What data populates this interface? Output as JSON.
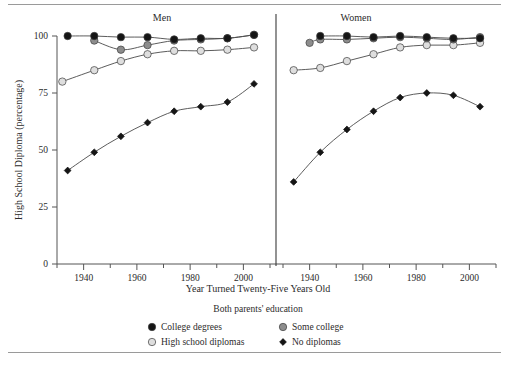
{
  "figure": {
    "ylabel": "High School Diploma (percentage)",
    "xlabel": "Year Turned Twenty-Five Years Old",
    "panel_men": "Men",
    "panel_women": "Women",
    "legend_title": "Both parents' education"
  },
  "axes": {
    "yticks": [
      "0",
      "25",
      "50",
      "75",
      "100"
    ],
    "xticks": [
      "1940",
      "1960",
      "1980",
      "2000"
    ]
  },
  "legend": {
    "items": [
      {
        "label": "College degrees",
        "marker": "filled-circle-icon",
        "color": "#151515"
      },
      {
        "label": "Some college",
        "marker": "gray-circle-icon",
        "color": "#8d8d8d"
      },
      {
        "label": "High school diplomas",
        "marker": "light-circle-icon",
        "color": "#dedede"
      },
      {
        "label": "No diplomas",
        "marker": "filled-diamond-icon",
        "color": "#151515"
      }
    ]
  },
  "chart_data": {
    "type": "line",
    "title": "",
    "xlabel": "Year Turned Twenty-Five Years Old",
    "ylabel": "High School Diploma (percentage)",
    "xlim": [
      1930,
      2010
    ],
    "ylim": [
      0,
      100
    ],
    "grid": false,
    "legend_position": "bottom",
    "legend_title": "Both parents' education",
    "panels": [
      {
        "name": "Men",
        "series": [
          {
            "name": "College degrees",
            "color": "#151515",
            "marker": "circle",
            "x": [
              1934,
              1944,
              1954,
              1964,
              1974,
              1984,
              1994,
              2004
            ],
            "values": [
              100,
              100,
              99.5,
              99.5,
              98.5,
              99,
              99,
              100.5
            ]
          },
          {
            "name": "Some college",
            "color": "#8d8d8d",
            "marker": "circle",
            "x": [
              1944,
              1954,
              1964,
              1974,
              1984,
              1994,
              2004
            ],
            "values": [
              98,
              94,
              96,
              98,
              98.5,
              99,
              100.5
            ]
          },
          {
            "name": "High school diplomas",
            "color": "#dedede",
            "marker": "circle",
            "x": [
              1932,
              1944,
              1954,
              1964,
              1974,
              1984,
              1994,
              2004
            ],
            "values": [
              80,
              85,
              89,
              92,
              93.5,
              93.5,
              94,
              95
            ]
          },
          {
            "name": "No diplomas",
            "color": "#151515",
            "marker": "diamond",
            "x": [
              1934,
              1944,
              1954,
              1964,
              1974,
              1984,
              1994,
              2004
            ],
            "values": [
              41,
              49,
              56,
              62,
              67,
              69,
              71,
              79
            ]
          }
        ]
      },
      {
        "name": "Women",
        "series": [
          {
            "name": "College degrees",
            "color": "#151515",
            "marker": "circle",
            "x": [
              1944,
              1954,
              1964,
              1974,
              1984,
              1994,
              2004
            ],
            "values": [
              100,
              100,
              99.5,
              100,
              99.5,
              99,
              99
            ]
          },
          {
            "name": "Some college",
            "color": "#8d8d8d",
            "marker": "circle",
            "x": [
              1940,
              1944,
              1954,
              1964,
              1974,
              1984,
              1994,
              2004
            ],
            "values": [
              97,
              98.5,
              98.5,
              99,
              99.5,
              99,
              98.5,
              99.5
            ]
          },
          {
            "name": "High school diplomas",
            "color": "#dedede",
            "marker": "circle",
            "x": [
              1934,
              1944,
              1954,
              1964,
              1974,
              1984,
              1994,
              2004
            ],
            "values": [
              85,
              86,
              89,
              92,
              95,
              96,
              96,
              97
            ]
          },
          {
            "name": "No diplomas",
            "color": "#151515",
            "marker": "diamond",
            "x": [
              1934,
              1944,
              1954,
              1964,
              1974,
              1984,
              1994,
              2004
            ],
            "values": [
              36,
              49,
              59,
              67,
              73,
              75,
              74,
              69
            ]
          }
        ]
      }
    ]
  }
}
